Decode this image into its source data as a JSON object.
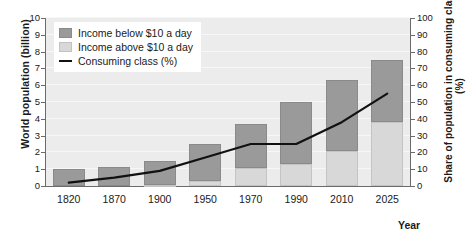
{
  "axes": {
    "y_left_title": "World population (billion)",
    "y_right_title": "Share of population in consuming class (%)",
    "x_title": "Year",
    "y_left_ticks": [
      "0",
      "1",
      "2",
      "3",
      "4",
      "5",
      "6",
      "7",
      "8",
      "9",
      "10"
    ],
    "y_right_ticks": [
      "0",
      "10",
      "20",
      "30",
      "40",
      "50",
      "60",
      "70",
      "80",
      "90",
      "100"
    ]
  },
  "legend": {
    "items": [
      {
        "label": "Income below $10 a day",
        "type": "swatch",
        "color": "#9a9a9a"
      },
      {
        "label": "Income above $10 a day",
        "type": "swatch",
        "color": "#d8d8d8"
      },
      {
        "label": "Consuming class (%)",
        "type": "line",
        "color": "#111111"
      }
    ]
  },
  "colors": {
    "below_10": "#9a9a9a",
    "above_10": "#d8d8d8",
    "line": "#111111",
    "plot_bg": "#ececec",
    "grid": "#f7f7f7",
    "axis": "#6b6b6b"
  },
  "chart_data": {
    "type": "bar",
    "title": "",
    "xlabel": "Year",
    "ylabel": "World population (billion)",
    "y2label": "Share of population in consuming class (%)",
    "ylim": [
      0,
      10
    ],
    "y2lim": [
      0,
      100
    ],
    "grid": true,
    "legend_position": "top-left",
    "categories": [
      "1820",
      "1870",
      "1900",
      "1950",
      "1970",
      "1990",
      "2010",
      "2025"
    ],
    "series": [
      {
        "name": "Income above $10 a day",
        "type": "bar",
        "stack": "population",
        "axis": "left",
        "color": "#d8d8d8",
        "values": [
          0.0,
          0.0,
          0.05,
          0.3,
          1.1,
          1.3,
          2.1,
          3.8
        ]
      },
      {
        "name": "Income below $10 a day",
        "type": "bar",
        "stack": "population",
        "axis": "left",
        "color": "#9a9a9a",
        "values": [
          1.0,
          1.15,
          1.45,
          2.2,
          2.6,
          3.7,
          4.2,
          3.7
        ]
      },
      {
        "name": "Consuming class (%)",
        "type": "line",
        "axis": "right",
        "color": "#111111",
        "values": [
          2,
          5,
          9,
          17,
          25,
          25,
          38,
          55
        ]
      }
    ],
    "totals_population": [
      1.0,
      1.15,
      1.5,
      2.5,
      3.7,
      5.0,
      6.3,
      7.5
    ]
  }
}
